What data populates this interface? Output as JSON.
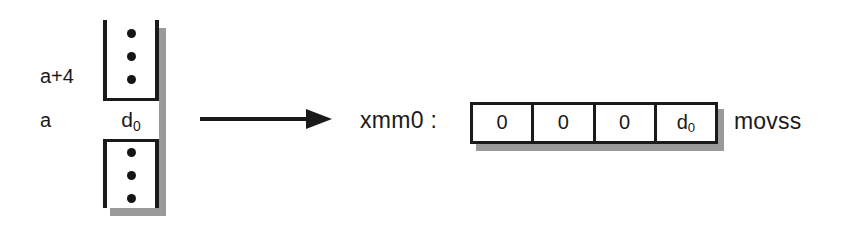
{
  "diagram": {
    "colors": {
      "ink": "#1a1a1a",
      "shadow": "#9a9a9a",
      "background": "#ffffff"
    }
  },
  "memory": {
    "name": "memory-column",
    "address_labels": [
      {
        "id": "a-plus-4",
        "text": "a+4"
      },
      {
        "id": "a",
        "text": "a"
      }
    ],
    "highlighted_cell": {
      "value_base": "d",
      "value_sub": "0"
    },
    "ellipsis_above_count": 3,
    "ellipsis_below_count": 3
  },
  "arrow": {
    "name": "transfer-arrow",
    "direction": "right"
  },
  "register": {
    "label": "xmm0 :",
    "lanes": [
      {
        "base": "0",
        "sub": ""
      },
      {
        "base": "0",
        "sub": ""
      },
      {
        "base": "0",
        "sub": ""
      },
      {
        "base": "d",
        "sub": "0"
      }
    ]
  },
  "instruction": {
    "mnemonic": "movss"
  }
}
